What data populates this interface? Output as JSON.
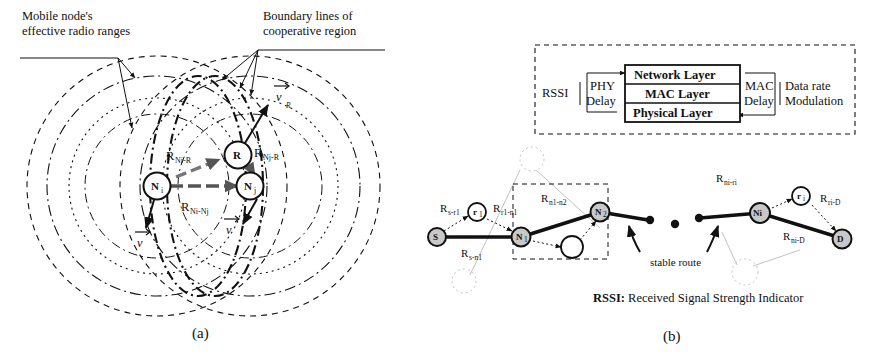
{
  "figure": {
    "panel_a": {
      "caption": "(a)",
      "annotations": [
        {
          "id": "ann-radio-range",
          "line1": "Mobile node's",
          "line2": "effective radio ranges"
        },
        {
          "id": "ann-boundary",
          "line1": "Boundary lines of",
          "line2": "cooperative region"
        }
      ],
      "nodes": [
        {
          "id": "node-ni",
          "base": "N",
          "sub": "i"
        },
        {
          "id": "node-nj",
          "base": "N",
          "sub": "j"
        },
        {
          "id": "node-r",
          "base": "R",
          "sub": ""
        }
      ],
      "distance_labels": [
        {
          "id": "dist-ni-r",
          "base": "R",
          "sub": "Ni-R"
        },
        {
          "id": "dist-nj-r",
          "base": "R",
          "sub": "Nj-R"
        },
        {
          "id": "dist-ni-nj",
          "base": "R",
          "sub": "Ni-Nj"
        }
      ],
      "velocity_labels": [
        {
          "id": "vel-ni",
          "base": "v",
          "sub": ""
        },
        {
          "id": "vel-nj",
          "base": "v",
          "sub": ""
        },
        {
          "id": "vel-r",
          "base": "v",
          "sub": "R"
        }
      ]
    },
    "panel_b": {
      "caption": "(b)",
      "stack": {
        "layers": [
          "Network Layer",
          "MAC Layer",
          "Physical Layer"
        ],
        "left_outer": "RSSI",
        "left_inner_line1": "PHY",
        "left_inner_line2": "Delay",
        "right_inner_line1": "MAC",
        "right_inner_line2": "Delay",
        "right_outer_line1": "Data rate",
        "right_outer_line2": "Modulation"
      },
      "route": {
        "nodes": [
          {
            "id": "route-node-s",
            "base": "S",
            "sub": ""
          },
          {
            "id": "route-node-r1",
            "base": "r",
            "sub": "1"
          },
          {
            "id": "route-node-n1",
            "base": "N",
            "sub": "1"
          },
          {
            "id": "route-node-n2",
            "base": "N",
            "sub": "2"
          },
          {
            "id": "route-node-ni",
            "base": "Ni",
            "sub": ""
          },
          {
            "id": "route-node-ri",
            "base": "r",
            "sub": "i"
          },
          {
            "id": "route-node-d",
            "base": "D",
            "sub": ""
          }
        ],
        "link_labels": [
          {
            "id": "link-s-r1",
            "base": "R",
            "sub": "s-r1"
          },
          {
            "id": "link-r1-n1",
            "base": "R",
            "sub": "r1-n1"
          },
          {
            "id": "link-s-n1",
            "base": "R",
            "sub": "s-n1"
          },
          {
            "id": "link-n1-n2",
            "base": "R",
            "sub": "n1-n2"
          },
          {
            "id": "link-ni-ri",
            "base": "R",
            "sub": "ni-ri"
          },
          {
            "id": "link-ri-d",
            "base": "R",
            "sub": "ri-D"
          },
          {
            "id": "link-ni-d",
            "base": "R",
            "sub": "ni-D"
          }
        ],
        "stable_route_label": "stable route"
      },
      "legend": {
        "abbr": "RSSI:",
        "expansion": " Received Signal Strength Indicator"
      }
    }
  },
  "colors": {
    "ink": "#111111",
    "node_fill": "#c8c8c8",
    "white": "#ffffff"
  }
}
